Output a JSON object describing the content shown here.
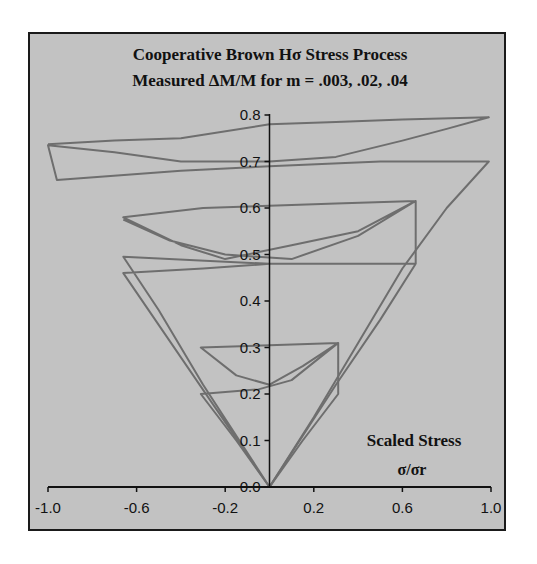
{
  "chart_data": {
    "type": "line",
    "title": "Cooperative Brown Hσ Stress Process",
    "subtitle": "Measured ΔM/M for m = .003, .02, .04",
    "xlabel": "Scaled Stress",
    "xlabel_sub": "σ/σr",
    "ylabel": "",
    "xlim": [
      -1.0,
      1.0
    ],
    "ylim": [
      0.0,
      0.8
    ],
    "x_ticks": [
      "-1.0",
      "-0.6",
      "-0.2",
      "0.2",
      "0.6",
      "1.0"
    ],
    "x_tick_values": [
      -1.0,
      -0.6,
      -0.2,
      0.2,
      0.6,
      1.0
    ],
    "y_ticks": [
      "0.0",
      "0.1",
      "0.2",
      "0.3",
      "0.4",
      "0.5",
      "0.6",
      "0.7",
      "0.8"
    ],
    "y_tick_values": [
      0.0,
      0.1,
      0.2,
      0.3,
      0.4,
      0.5,
      0.6,
      0.7,
      0.8
    ],
    "grid": false,
    "legend": "none",
    "line_color": "#6e6e6e",
    "series": [
      {
        "name": "loop amplitude 1.0 (outer)",
        "points": [
          [
            0.0,
            0.0
          ],
          [
            0.2,
            0.15
          ],
          [
            0.4,
            0.31
          ],
          [
            0.6,
            0.47
          ],
          [
            0.8,
            0.6
          ],
          [
            0.99,
            0.7
          ],
          [
            0.5,
            0.7
          ],
          [
            0.0,
            0.69
          ],
          [
            -0.4,
            0.68
          ],
          [
            -0.96,
            0.66
          ],
          [
            -1.0,
            0.735
          ],
          [
            -0.7,
            0.72
          ],
          [
            -0.4,
            0.7
          ],
          [
            -0.2,
            0.7
          ],
          [
            0.0,
            0.7
          ],
          [
            0.3,
            0.71
          ],
          [
            0.6,
            0.745
          ],
          [
            0.8,
            0.77
          ],
          [
            0.99,
            0.795
          ],
          [
            0.6,
            0.79
          ],
          [
            0.3,
            0.785
          ],
          [
            0.0,
            0.78
          ],
          [
            -0.4,
            0.75
          ],
          [
            -0.7,
            0.745
          ],
          [
            -1.0,
            0.737
          ]
        ]
      },
      {
        "name": "loop amplitude 0.66",
        "points": [
          [
            0.0,
            0.0
          ],
          [
            0.3,
            0.22
          ],
          [
            0.5,
            0.36
          ],
          [
            0.66,
            0.48
          ],
          [
            0.3,
            0.48
          ],
          [
            0.0,
            0.48
          ],
          [
            -0.66,
            0.495
          ],
          [
            -0.5,
            0.38
          ],
          [
            -0.3,
            0.22
          ],
          [
            0.0,
            0.0
          ],
          [
            -0.66,
            0.46
          ],
          [
            -0.3,
            0.47
          ],
          [
            0.0,
            0.48
          ],
          [
            0.66,
            0.48
          ],
          [
            0.66,
            0.615
          ],
          [
            0.4,
            0.55
          ],
          [
            0.1,
            0.52
          ],
          [
            -0.2,
            0.49
          ],
          [
            -0.4,
            0.52
          ],
          [
            -0.66,
            0.58
          ],
          [
            -0.3,
            0.6
          ],
          [
            0.0,
            0.605
          ],
          [
            0.3,
            0.61
          ],
          [
            0.66,
            0.615
          ],
          [
            0.4,
            0.54
          ],
          [
            0.1,
            0.49
          ],
          [
            -0.2,
            0.5
          ],
          [
            -0.45,
            0.53
          ],
          [
            -0.66,
            0.575
          ]
        ]
      },
      {
        "name": "loop amplitude 0.31",
        "points": [
          [
            0.0,
            0.0
          ],
          [
            0.15,
            0.1
          ],
          [
            0.31,
            0.2
          ],
          [
            0.31,
            0.31
          ],
          [
            0.15,
            0.26
          ],
          [
            0.0,
            0.22
          ],
          [
            -0.15,
            0.24
          ],
          [
            -0.31,
            0.3
          ],
          [
            0.0,
            0.305
          ],
          [
            0.31,
            0.31
          ],
          [
            0.1,
            0.23
          ],
          [
            -0.05,
            0.21
          ],
          [
            -0.31,
            0.2
          ],
          [
            -0.15,
            0.1
          ],
          [
            0.0,
            0.0
          ]
        ]
      }
    ]
  }
}
